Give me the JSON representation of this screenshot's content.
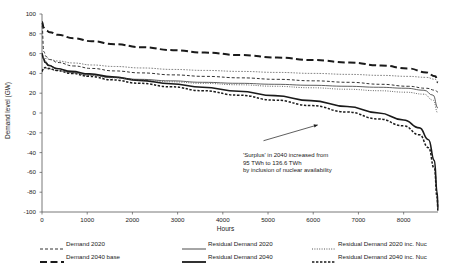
{
  "chart_data": {
    "type": "line",
    "title": "",
    "xlabel": "Hours",
    "ylabel": "Demand level (GW)",
    "xlim": [
      0,
      8760
    ],
    "ylim": [
      -100,
      100
    ],
    "xticks": [
      0,
      1000,
      2000,
      3000,
      4000,
      5000,
      6000,
      7000,
      8000
    ],
    "yticks": [
      -100,
      -80,
      -60,
      -40,
      -20,
      0,
      20,
      40,
      60,
      80,
      100
    ],
    "grid": false,
    "legend_position": "bottom",
    "annotations": [
      {
        "lines": [
          "'Surplus' in 2040 increased from",
          "95 TWh to 136.6 TWh",
          "by inclusion of nuclear availability"
        ],
        "arrow_from_x": 4900,
        "arrow_from_y": -28,
        "arrow_to_x": 6100,
        "arrow_to_y": -12
      }
    ],
    "series": [
      {
        "name": "Demand 2020",
        "style": "dashed",
        "width": 1.0,
        "color": "#333333",
        "x": [
          0,
          40,
          90,
          175,
          350,
          700,
          1100,
          1600,
          2200,
          2900,
          3600,
          4400,
          5200,
          6000,
          6800,
          7500,
          8100,
          8500,
          8700,
          8760
        ],
        "y": [
          88,
          62,
          57,
          54,
          51,
          47.5,
          45,
          42.5,
          40.5,
          38.5,
          37,
          35.5,
          34,
          32.5,
          31,
          29,
          27,
          25,
          23,
          21
        ]
      },
      {
        "name": "Demand 2040 base",
        "style": "long-dash",
        "width": 2.0,
        "color": "#1a1a1a",
        "x": [
          0,
          40,
          90,
          175,
          350,
          700,
          1100,
          1600,
          2200,
          2900,
          3600,
          4400,
          5200,
          6000,
          6800,
          7500,
          8100,
          8500,
          8700,
          8760
        ],
        "y": [
          92,
          86,
          83.5,
          81.5,
          79,
          75.5,
          72.5,
          69.5,
          66.5,
          63.5,
          61,
          58.5,
          56,
          53.5,
          51,
          48,
          45,
          41,
          37,
          31
        ]
      },
      {
        "name": "Residual Demand 2020",
        "style": "solid",
        "width": 0.9,
        "color": "#4d4d4d",
        "x": [
          0,
          30,
          70,
          150,
          320,
          650,
          1050,
          1550,
          2150,
          2850,
          3550,
          4350,
          5150,
          5950,
          6750,
          7450,
          8050,
          8450,
          8650,
          8760
        ],
        "y": [
          60,
          56,
          52.5,
          48.5,
          45,
          41,
          38.5,
          36,
          34,
          32.5,
          31,
          30,
          29,
          28,
          27,
          26,
          25,
          23,
          18,
          5
        ]
      },
      {
        "name": "Residual Demand 2040",
        "style": "solid",
        "width": 1.6,
        "color": "#1a1a1a",
        "x": [
          0,
          30,
          70,
          150,
          320,
          650,
          1050,
          1550,
          2150,
          2850,
          3550,
          4350,
          5150,
          5950,
          6750,
          7450,
          8000,
          8350,
          8550,
          8680,
          8740,
          8760
        ],
        "y": [
          60,
          55,
          51,
          48,
          45,
          42,
          39.5,
          36.5,
          33,
          29.5,
          26,
          22,
          17.5,
          12.5,
          6.5,
          0,
          -7,
          -15,
          -27,
          -48,
          -80,
          -97
        ]
      },
      {
        "name": "Residual Demand 2020 inc. Nuc",
        "style": "dotted",
        "width": 0.9,
        "color": "#555555",
        "x": [
          0,
          30,
          70,
          150,
          320,
          650,
          1050,
          1550,
          2150,
          2850,
          3550,
          4350,
          5150,
          5950,
          6750,
          7450,
          8050,
          8450,
          8650,
          8760
        ],
        "y": [
          42,
          44,
          45,
          44.5,
          43,
          40.5,
          38,
          35.5,
          33.5,
          31.5,
          30,
          28.5,
          27,
          25.5,
          24,
          22.5,
          21,
          19,
          13,
          0
        ]
      },
      {
        "name": "Residual Demand 2040 inc. Nuc",
        "style": "dash-dense",
        "width": 1.5,
        "color": "#1a1a1a",
        "x": [
          0,
          30,
          70,
          150,
          320,
          650,
          1050,
          1550,
          2150,
          2850,
          3550,
          4350,
          5150,
          5950,
          6750,
          7450,
          8000,
          8350,
          8550,
          8680,
          8740,
          8760
        ],
        "y": [
          42,
          45,
          46,
          45,
          43,
          40,
          37,
          33.5,
          30,
          26.5,
          22.5,
          18,
          13,
          7.5,
          1,
          -6,
          -13,
          -22,
          -35,
          -56,
          -85,
          -99
        ]
      },
      {
        "name": "Residual Demand 2040 upper band",
        "style": "dotted-fine",
        "width": 0.9,
        "color": "#777777",
        "x": [
          0,
          40,
          90,
          175,
          350,
          700,
          1100,
          1600,
          2200,
          2900,
          3600,
          4400,
          5200,
          6000,
          6800,
          7500,
          8100,
          8500,
          8700,
          8760
        ],
        "y": [
          55,
          55.5,
          55,
          54,
          52.5,
          50.5,
          48.5,
          47,
          45.5,
          44,
          43,
          42,
          41,
          40,
          39,
          38,
          37,
          36,
          34,
          31
        ]
      }
    ]
  },
  "legend": {
    "items": [
      {
        "label": "Demand 2020",
        "style": "dashed"
      },
      {
        "label": "Demand 2040 base",
        "style": "long-dash"
      },
      {
        "label": "Residual Demand 2020",
        "style": "solid-thin"
      },
      {
        "label": "Residual Demand 2040",
        "style": "solid-thick"
      },
      {
        "label": "Residual Demand 2020 inc. Nuc",
        "style": "dotted"
      },
      {
        "label": "Residual Demand 2040 inc. Nuc",
        "style": "dash-dense"
      }
    ]
  }
}
